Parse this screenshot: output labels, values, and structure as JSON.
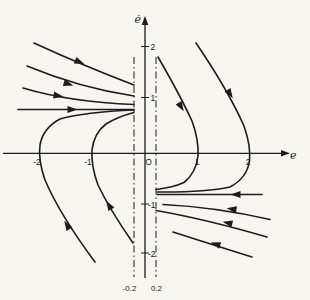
{
  "colors": {
    "ink": "#1c1c1c",
    "background": "#f7f5f0"
  },
  "axes": {
    "x_label": "e",
    "y_label": "ė",
    "origin_label": "O",
    "x_tick_labels": [
      "-2",
      "-1",
      "1",
      "2"
    ],
    "y_tick_labels": [
      "2",
      "1",
      "-1",
      "-2"
    ],
    "deadzone_left_label": "-0.2",
    "deadzone_right_label": "0.2"
  },
  "curves": [
    {
      "name": "left-upper-trajectory-1",
      "d": "M34 43 C 60 55, 100 72, 134 85",
      "arrow": {
        "x": 83,
        "y": 63.5,
        "angle": 23
      }
    },
    {
      "name": "left-upper-trajectory-2",
      "d": "M27 66 Q 80 88 134 96",
      "arrow": {
        "x": 72,
        "y": 85,
        "angle": 16
      }
    },
    {
      "name": "left-upper-trajectory-3",
      "d": "M23 88 Q 70 102 134 104.5",
      "arrow": {
        "x": 62,
        "y": 96.5,
        "angle": 10
      }
    },
    {
      "name": "left-asymptote-line",
      "d": "M18 109.5 L134 109.5",
      "arrow": {
        "x": 76,
        "y": 109.5,
        "angle": 0
      }
    },
    {
      "name": "left-lower-outer-trajectory",
      "d": "M95 262 Q 60 215 45 180 Q 38 160 40 145 Q 43 128 60 119 Q 85 112 134 110",
      "arrow": {
        "x": 65,
        "y": 222,
        "angle": -122
      }
    },
    {
      "name": "left-lower-inner-trajectory",
      "d": "M133 243 Q 110 210 98 185 Q 91 166 92 150 Q 94 133 106 124 Q 117 117 134 112.5",
      "arrow": {
        "x": 107,
        "y": 202,
        "angle": -121
      }
    },
    {
      "name": "right-upper-inner-trajectory",
      "d": "M158 57 Q 180 95 192 121 Q 199 140 198 156 Q 196 173 184 182.5 Q 173 187.5 156 189.5",
      "arrow": {
        "x": 183,
        "y": 110,
        "angle": 59
      }
    },
    {
      "name": "right-upper-outer-trajectory",
      "d": "M196 43 Q 228 90 244 126 Q 251 146 249.5 161 Q 247 178 230 187 Q 205 192.5 157 192",
      "arrow": {
        "x": 232,
        "y": 97,
        "angle": 58
      }
    },
    {
      "name": "right-asymptote-line",
      "d": "M157 194.5 L262 194.5",
      "arrow": {
        "x": 232,
        "y": 194.5,
        "angle": 180
      }
    },
    {
      "name": "right-lower-trajectory-1",
      "d": "M163 204.5 Q 215 207 270 219.5",
      "arrow": {
        "x": 228,
        "y": 208.5,
        "angle": 188
      }
    },
    {
      "name": "right-lower-trajectory-2",
      "d": "M156 210.5 Q 205 219 267 237",
      "arrow": {
        "x": 224,
        "y": 222,
        "angle": 193
      }
    },
    {
      "name": "right-lower-trajectory-3",
      "d": "M173 232 Q 215 245.5 252 257",
      "arrow": {
        "x": 212,
        "y": 243,
        "angle": 197
      }
    }
  ]
}
